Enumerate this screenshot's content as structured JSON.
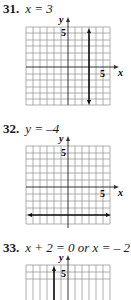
{
  "problems": [
    {
      "number": "31.",
      "equation": "x = 3",
      "graph": {
        "x_label": "x",
        "y_label": "y",
        "x_tick_label": "5",
        "y_tick_label": "5",
        "line": {
          "type": "vertical",
          "x": 3,
          "arrows": "both"
        }
      }
    },
    {
      "number": "32.",
      "equation": "y = –4",
      "graph": {
        "x_label": "x",
        "y_label": "y",
        "x_tick_label": "5",
        "y_tick_label": "5",
        "line": {
          "type": "horizontal",
          "y": -4,
          "arrows": "both"
        }
      }
    },
    {
      "number": "33.",
      "equation": "x + 2 = 0  or x = – 2",
      "graph": {
        "y_label": "y",
        "y_tick_label": "5",
        "line": {
          "type": "vertical",
          "x": -2,
          "arrows": "both"
        }
      }
    }
  ],
  "colors": {
    "grid": "#9a9a9a",
    "axis": "#333333",
    "line": "#111111"
  }
}
